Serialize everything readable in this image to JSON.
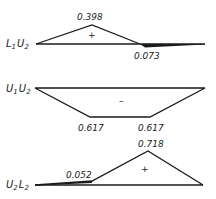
{
  "diagram": {
    "type": "influence-lines",
    "panels": [
      {
        "member": "L₁U₂",
        "member_main": "L",
        "member_sub1": "1",
        "member_second": "U",
        "member_sub2": "2",
        "sign_region": "+",
        "values": [
          {
            "label": "0.398",
            "sign": "+",
            "position": "peak"
          },
          {
            "label": "0.073",
            "sign": "-",
            "position": "dip"
          }
        ]
      },
      {
        "member": "U₁U₂",
        "member_main": "U",
        "member_sub1": "1",
        "member_second": "U",
        "member_sub2": "2",
        "sign_region": "–",
        "values": [
          {
            "label": "0.617",
            "sign": "-",
            "position": "left-plateau"
          },
          {
            "label": "0.617",
            "sign": "-",
            "position": "right-plateau"
          }
        ]
      },
      {
        "member": "U₂L₂",
        "member_main": "U",
        "member_sub1": "2",
        "member_second": "L",
        "member_sub2": "2",
        "sign_region": "+",
        "values": [
          {
            "label": "0.052",
            "sign": "+",
            "position": "kink"
          },
          {
            "label": "0.718",
            "sign": "+",
            "position": "peak"
          }
        ]
      }
    ]
  }
}
